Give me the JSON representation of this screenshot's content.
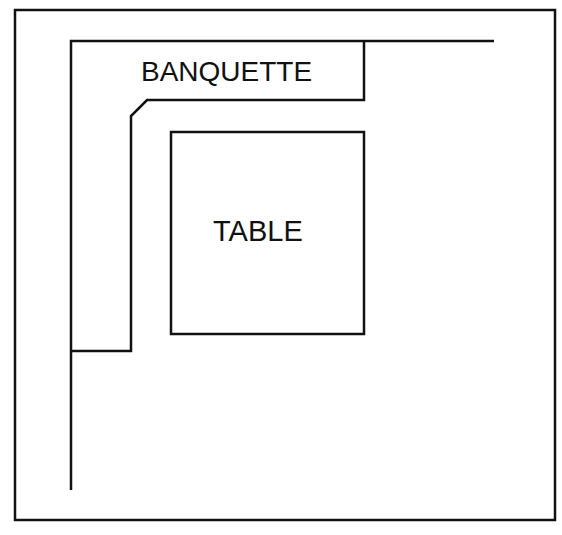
{
  "diagram": {
    "type": "floor-plan",
    "stroke_color": "#111111",
    "background_color": "#ffffff",
    "labels": {
      "banquette": "BANQUETTE",
      "table": "TABLE"
    },
    "elements": [
      {
        "name": "outer-frame",
        "kind": "rectangle"
      },
      {
        "name": "wall-line",
        "kind": "polyline"
      },
      {
        "name": "banquette",
        "kind": "polygon",
        "label": "BANQUETTE"
      },
      {
        "name": "table",
        "kind": "rectangle",
        "label": "TABLE"
      }
    ]
  }
}
